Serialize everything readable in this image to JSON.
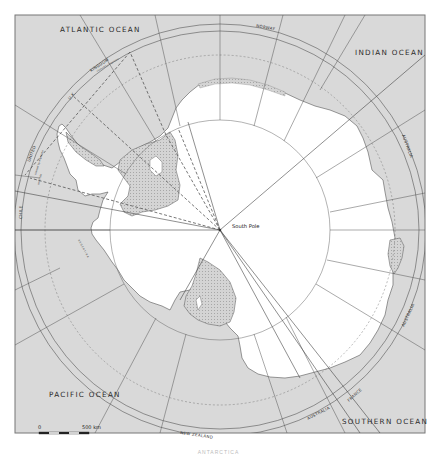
{
  "map": {
    "title": "Antarctica territorial claims",
    "colors": {
      "ocean": "#d9d9d9",
      "land": "#ffffff",
      "ice_shelf": "#cfcfcf",
      "lines": "#555555",
      "frame": "#777777",
      "text": "#2a2a2a"
    },
    "ocean_labels": {
      "atlantic": "ATLANTIC OCEAN",
      "indian": "INDIAN OCEAN",
      "pacific": "PACIFIC OCEAN",
      "southern": "SOUTHERN OCEAN"
    },
    "claim_labels": {
      "norway": "NORWAY",
      "uk_kingdom": "KINGDOM",
      "uk_short": "U.K.",
      "united": "UNITED",
      "chile": "CHILE",
      "australia_east": "AUSTRALIA",
      "australia_southeast": "AUSTRALIA",
      "australia_south": "AUSTRALIA",
      "france": "FRANCE",
      "new_zealand": "NEW ZEALAND",
      "argentina_dotted": "A R G E N T I N A",
      "uk_note": "claimed by Argentina",
      "united_note1": "claimed by Argentina",
      "united_note2": "and Chile"
    },
    "pole_label": "South Pole",
    "scale": {
      "start": "0",
      "end": "500 km"
    },
    "caption": "ANTARCTICA"
  }
}
